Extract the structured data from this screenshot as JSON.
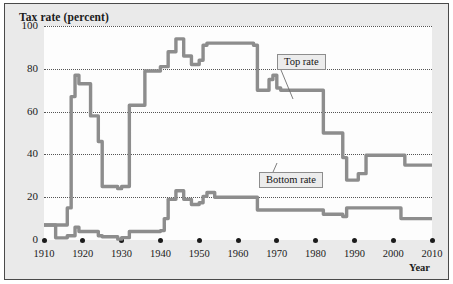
{
  "figure": {
    "title": "Tax rate (percent)",
    "xaxis_label": "Year"
  },
  "annotations": {
    "top_rate_label": "Top rate",
    "bottom_rate_label": "Bottom rate"
  },
  "colors": {
    "line": "#8d8d8d",
    "grid": "#555555",
    "panel": "#eaeaea",
    "plot_background": "#fdfdfd",
    "text": "#1a1a1a",
    "border": "#4a4a4a"
  },
  "chart_data": {
    "type": "line",
    "title": "Tax rate (percent)",
    "xlabel": "Year",
    "ylabel": "Tax rate (percent)",
    "xlim": [
      1910,
      2010
    ],
    "ylim": [
      0,
      100
    ],
    "grid": true,
    "step_style": "post",
    "xticks": [
      1910,
      1920,
      1930,
      1940,
      1950,
      1960,
      1970,
      1980,
      1990,
      2000,
      2010
    ],
    "xtick_labels": [
      "1910",
      "1920",
      "1930",
      "1940",
      "1950",
      "1960",
      "1970",
      "1980",
      "1990",
      "2000",
      "2010"
    ],
    "yticks": [
      0,
      20,
      40,
      60,
      80,
      100
    ],
    "ytick_labels": [
      "0",
      "20",
      "40",
      "60",
      "80",
      "100"
    ],
    "legend_position": "inline-callouts",
    "series": [
      {
        "name": "Top rate",
        "x": [
          1910,
          1913,
          1914,
          1915,
          1916,
          1917,
          1918,
          1919,
          1921,
          1922,
          1924,
          1925,
          1926,
          1929,
          1930,
          1932,
          1936,
          1938,
          1940,
          1941,
          1942,
          1944,
          1946,
          1948,
          1950,
          1951,
          1952,
          1954,
          1964,
          1965,
          1968,
          1969,
          1970,
          1971,
          1981,
          1982,
          1987,
          1988,
          1991,
          1993,
          2003,
          2010
        ],
        "values": [
          7,
          7,
          7,
          7,
          15,
          67,
          77,
          73,
          73,
          58,
          46,
          25,
          25,
          24,
          25,
          63,
          79,
          79,
          81,
          81,
          88,
          94,
          86,
          82,
          84,
          91,
          92,
          92,
          91,
          70,
          75,
          77,
          71,
          70,
          70,
          50,
          38.5,
          28,
          31,
          39.6,
          35,
          35
        ]
      },
      {
        "name": "Bottom rate",
        "x": [
          1910,
          1913,
          1916,
          1917,
          1918,
          1919,
          1921,
          1924,
          1925,
          1929,
          1930,
          1932,
          1936,
          1940,
          1941,
          1942,
          1944,
          1946,
          1948,
          1950,
          1951,
          1952,
          1954,
          1964,
          1965,
          1971,
          1979,
          1982,
          1987,
          1988,
          1991,
          2001,
          2002,
          2010
        ],
        "values": [
          7,
          1,
          2,
          2,
          6,
          4,
          4,
          2,
          1.5,
          0.4,
          1.1,
          4,
          4,
          4.4,
          10,
          19,
          23,
          19,
          16.6,
          17.4,
          20.4,
          22.2,
          20,
          20,
          14,
          14,
          14,
          12,
          11,
          15,
          15,
          15,
          10,
          10
        ]
      }
    ]
  }
}
